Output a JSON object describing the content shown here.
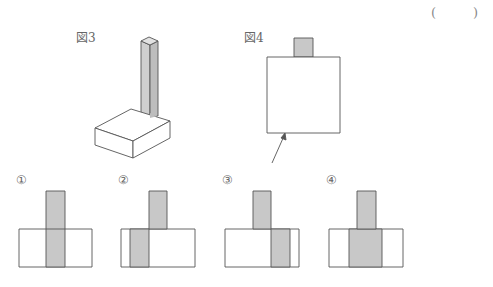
{
  "answer_bracket": {
    "open": "(",
    "close": ")"
  },
  "figures": {
    "fig3": {
      "label": "図3",
      "description": "square prism standing on a square slab (isometric)"
    },
    "fig4": {
      "label": "図4",
      "description": "view from above: square with small square on top edge; arrow indicates viewing direction"
    }
  },
  "options": [
    {
      "label": "①"
    },
    {
      "label": "②"
    },
    {
      "label": "③"
    },
    {
      "label": "④"
    }
  ],
  "colors": {
    "shade": "#c8c8c8",
    "line": "#555555"
  }
}
